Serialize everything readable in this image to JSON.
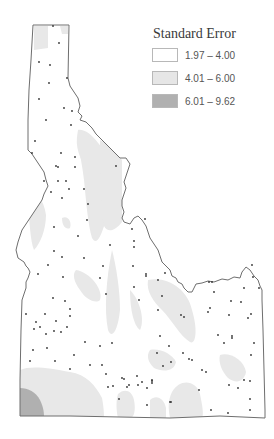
{
  "map": {
    "region": "Idaho",
    "border_color": "#6e6e6e",
    "dot_color": "#333333"
  },
  "legend": {
    "title": "Standard Error",
    "items": [
      {
        "label": "1.97 – 4.00",
        "color": "#ffffff"
      },
      {
        "label": "4.01 – 6.00",
        "color": "#e6e6e6"
      },
      {
        "label": "6.01 – 9.62",
        "color": "#b0b0b0"
      }
    ]
  }
}
